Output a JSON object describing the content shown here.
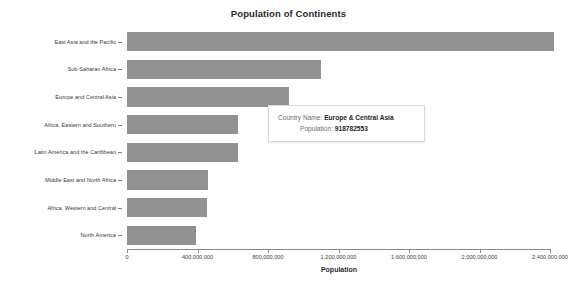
{
  "chart_data": {
    "type": "bar",
    "orientation": "horizontal",
    "title": "Population of Continents",
    "xlabel": "Population",
    "ylabel": "",
    "grid": false,
    "legend": "none",
    "xlim": [
      0,
      2400000000
    ],
    "xticks": [
      0,
      400000000,
      800000000,
      1200000000,
      1600000000,
      2000000000,
      2400000000
    ],
    "xtick_labels": [
      "0",
      "400,000,000",
      "800,000,000",
      "1,200,000,000",
      "1,600,000,000",
      "2,000,000,000",
      "2,400,000,000"
    ],
    "bar_color": "#919191",
    "categories": [
      "East Asia and the Pacific",
      "Sub-Saharan Africa",
      "Europe and Central Asia",
      "Africa, Eastern and Southern",
      "Latin America and the Caribbean",
      "Middle East and North Africa",
      "Africa, Western and Central",
      "North America"
    ],
    "values": [
      2420000000,
      1100000000,
      918782553,
      630000000,
      630000000,
      460000000,
      455000000,
      390000000
    ]
  },
  "tooltip": {
    "visible": true,
    "name_label": "Country Name:",
    "name_value": "Europe & Central Asia",
    "population_label": "Population:",
    "population_value": "918782553"
  }
}
